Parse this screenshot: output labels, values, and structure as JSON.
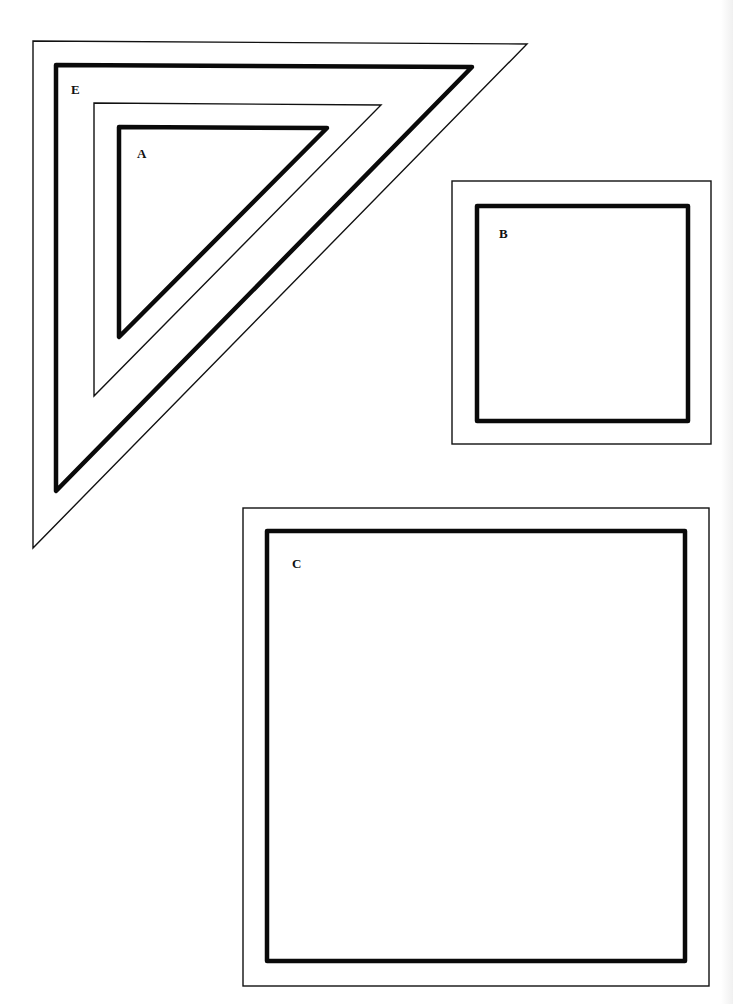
{
  "diagram": {
    "type": "nested-shapes",
    "background": "#ffffff",
    "stroke_color": "#111111",
    "shapes": [
      {
        "id": "E",
        "label": "E",
        "kind": "right-triangle",
        "description": "outer triangle frame with thick inner outline"
      },
      {
        "id": "A",
        "label": "A",
        "kind": "right-triangle",
        "description": "inner triangle frame with thick inner outline, nested inside E"
      },
      {
        "id": "B",
        "label": "B",
        "kind": "square",
        "description": "small square frame with thick inner outline"
      },
      {
        "id": "C",
        "label": "C",
        "kind": "square",
        "description": "large square frame with thick inner outline"
      }
    ]
  }
}
